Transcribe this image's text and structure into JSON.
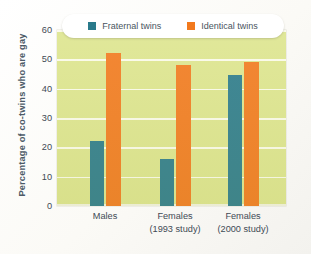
{
  "chart_data": {
    "type": "bar",
    "title": "",
    "subtitle": "",
    "xlabel": "",
    "ylabel": "Percentage of co-twins who are gay",
    "ylim": [
      0,
      60
    ],
    "yticks": [
      0,
      10,
      20,
      30,
      40,
      50,
      60
    ],
    "grid": true,
    "legend_position": "top-center",
    "categories": [
      "Males",
      "Females (1993 study)",
      "Females (2000 study)"
    ],
    "category_lines": [
      {
        "line1": "Males",
        "line2": ""
      },
      {
        "line1": "Females",
        "line2": "(1993 study)"
      },
      {
        "line1": "Females",
        "line2": "(2000 study)"
      }
    ],
    "series": [
      {
        "name": "Fraternal twins",
        "color": "#2a7a8b",
        "values": [
          22,
          16,
          44.5
        ]
      },
      {
        "name": "Identical twins",
        "color": "#f2791d",
        "values": [
          52,
          48,
          49
        ]
      }
    ]
  },
  "legend": {
    "entries": [
      {
        "label": "Fraternal twins",
        "swatch": "fraternal-swatch"
      },
      {
        "label": "Identical twins",
        "swatch": "identical-swatch"
      }
    ]
  },
  "axes": {
    "y_title": "Percentage of co-twins who are gay",
    "y_ticks": [
      "60",
      "50",
      "40",
      "30",
      "20",
      "10",
      "0"
    ]
  },
  "colors": {
    "plot_background": "#dde58e",
    "gridline": "#fdfdf3",
    "fraternal": "#2a7a8b",
    "identical": "#f2791d",
    "axis_text": "#3f4a55",
    "title_text": "#4c5a67"
  }
}
